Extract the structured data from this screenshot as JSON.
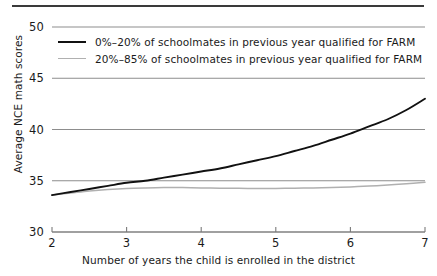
{
  "chart_data": {
    "type": "line",
    "title": "",
    "xlabel": "Number of years the child is enrolled in the district",
    "ylabel": "Average NCE math scores",
    "xlim": [
      2,
      7
    ],
    "ylim": [
      30,
      50
    ],
    "xticks": [
      "2",
      "3",
      "4",
      "5",
      "6",
      "7"
    ],
    "yticks": [
      "30",
      "35",
      "40",
      "45",
      "50"
    ],
    "grid": "horizontal gridlines at each y tick",
    "legend_position": "inside plot area, upper left",
    "x": [
      2,
      2.25,
      2.5,
      2.75,
      3,
      3.25,
      3.5,
      3.75,
      4,
      4.25,
      4.5,
      4.75,
      5,
      5.25,
      5.5,
      5.75,
      6,
      6.25,
      6.5,
      6.75,
      7
    ],
    "series": [
      {
        "name": "0%-20% of schoolmates in previous year qualified for FARM",
        "color": "#111111",
        "values": [
          33.6,
          33.9,
          34.2,
          34.5,
          34.8,
          35.0,
          35.3,
          35.6,
          35.9,
          36.2,
          36.6,
          37.0,
          37.4,
          37.9,
          38.4,
          39.0,
          39.6,
          40.3,
          41.0,
          41.9,
          43.0
        ]
      },
      {
        "name": "20%-85% of schoolmates in previous year qualified for FARM",
        "color": "#b0b0b0",
        "values": [
          33.6,
          33.8,
          34.0,
          34.15,
          34.25,
          34.3,
          34.33,
          34.33,
          34.3,
          34.28,
          34.26,
          34.25,
          34.25,
          34.27,
          34.3,
          34.35,
          34.4,
          34.48,
          34.58,
          34.7,
          34.85
        ]
      }
    ]
  },
  "legend": {
    "entries": [
      {
        "label": "0%–20% of schoolmates in previous year qualified for FARM",
        "swatch": "dark-line-swatch"
      },
      {
        "label": "20%–85% of schoolmates in previous year qualified for FARM",
        "swatch": "light-line-swatch"
      }
    ]
  },
  "axes": {
    "y_title": "Average NCE math scores",
    "x_title": "Number of years the child is enrolled in the district",
    "y_tick_labels": [
      "50",
      "45",
      "40",
      "35",
      "30"
    ],
    "x_tick_labels": [
      "2",
      "3",
      "4",
      "5",
      "6",
      "7"
    ]
  }
}
